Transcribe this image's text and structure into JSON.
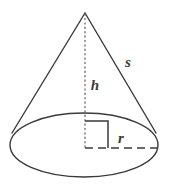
{
  "figure": {
    "name": "cone-geometry-diagram",
    "shape": "cone",
    "background_color": "#ffffff",
    "stroke_color": "#3a3a3a",
    "label_color": "#3a3a3a"
  },
  "labels": {
    "slant_height": "s",
    "height": "h",
    "radius": "r"
  },
  "geometry": {
    "apex": {
      "x": 85,
      "y": 13
    },
    "base_ellipse": {
      "cx": 84,
      "cy": 145,
      "rx": 74,
      "ry": 32
    },
    "left_tangent": {
      "x": 12,
      "y": 133
    },
    "right_tangent": {
      "x": 156,
      "y": 133
    },
    "height_line": {
      "x": 85,
      "y1": 13,
      "y2": 148,
      "style": "dotted"
    },
    "radius_line": {
      "y": 148,
      "x1": 85,
      "x2": 157,
      "style": "dashed"
    },
    "right_angle_marker": {
      "x1": 85,
      "y1": 121,
      "x2": 108,
      "y2": 148,
      "style": "solid"
    }
  },
  "label_positions": {
    "slant_height": {
      "x": 128,
      "y": 67
    },
    "height": {
      "x": 95,
      "y": 90
    },
    "radius": {
      "x": 121,
      "y": 143
    }
  }
}
